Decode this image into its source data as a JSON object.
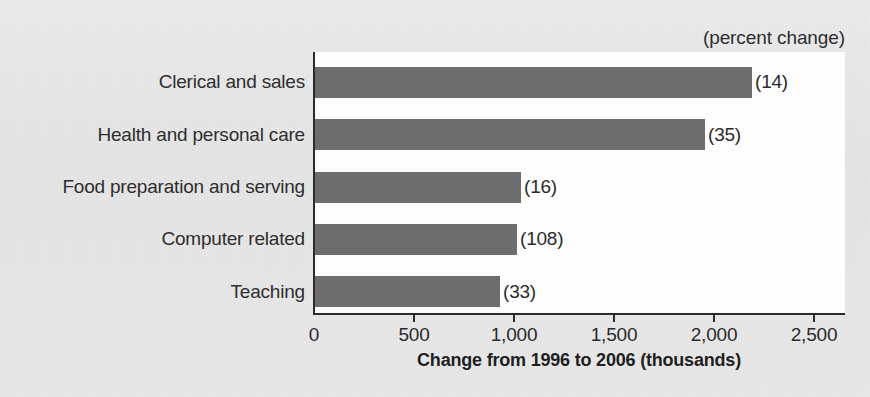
{
  "chart_data": {
    "type": "bar",
    "orientation": "horizontal",
    "title": "",
    "subtitle": "",
    "unit_note": "(percent change)",
    "xlabel": "Change from 1996 to 2006 (thousands)",
    "ylabel": "",
    "xlim": [
      0,
      2660
    ],
    "xticks": [
      0,
      500,
      1000,
      1500,
      2000,
      2500
    ],
    "xtick_labels": [
      "0",
      "500",
      "1,000",
      "1,500",
      "2,000",
      "2,500"
    ],
    "grid": false,
    "legend": null,
    "categories": [
      "Clerical and sales",
      "Health and personal care",
      "Food preparation and serving",
      "Computer related",
      "Teaching"
    ],
    "values": [
      2185,
      1950,
      1030,
      1010,
      925
    ],
    "data_labels": [
      "(14)",
      "(35)",
      "(16)",
      "(108)",
      "(33)"
    ],
    "percent_change": [
      14,
      35,
      16,
      108,
      33
    ],
    "bar_color": "#6d6d6d",
    "plot_background": "#fdfdfd",
    "page_background": "#e7e7e7",
    "axis_color": "#2b2b2b"
  }
}
